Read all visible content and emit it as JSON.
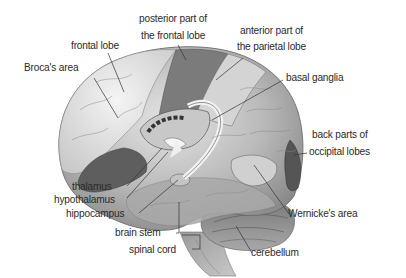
{
  "diagram": {
    "background_color": "#ffffff",
    "label_color": "#2a2a2a",
    "labels": {
      "frontal_lobe": "frontal lobe",
      "brocas_area": "Broca's area",
      "posterior_frontal_line1": "posterior part of",
      "posterior_frontal_line2": "the frontal lobe",
      "anterior_parietal_line1": "anterior part of",
      "anterior_parietal_line2": "the parietal lobe",
      "basal_ganglia": "basal ganglia",
      "occipital_line1": "back parts of",
      "occipital_line2": "occipital lobes",
      "thalamus": "thalamus",
      "hypothalamus": "hypothalamus",
      "hippocampus": "hippocampus",
      "brain_stem": "brain stem",
      "spinal_cord": "spinal cord",
      "wernickes_area": "Wernicke's area",
      "cerebellum": "cerebellum"
    }
  }
}
